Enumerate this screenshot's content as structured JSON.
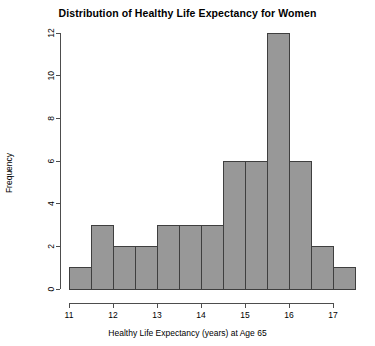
{
  "chart_data": {
    "type": "bar",
    "title": "Distribution of Healthy Life Expectancy for Women",
    "xlabel": "Healthy Life Expectancy (years) at Age 65",
    "ylabel": "Frequency",
    "bin_width": 0.5,
    "bin_edges": [
      11,
      11.5,
      12,
      12.5,
      13,
      13.5,
      14,
      14.5,
      15,
      15.5,
      16,
      16.5,
      17,
      17.5
    ],
    "categories": [
      "11-11.5",
      "11.5-12",
      "12-12.5",
      "12.5-13",
      "13-13.5",
      "13.5-14",
      "14-14.5",
      "14.5-15",
      "15-15.5",
      "15.5-16",
      "16-16.5",
      "16.5-17",
      "17-17.5"
    ],
    "values": [
      1,
      3,
      2,
      2,
      3,
      3,
      3,
      6,
      6,
      12,
      6,
      2,
      1
    ],
    "xlim": [
      11,
      17.5
    ],
    "ylim": [
      0,
      12
    ],
    "x_ticks": [
      11,
      12,
      13,
      14,
      15,
      16,
      17
    ],
    "x_tick_labels": [
      "11",
      "12",
      "13",
      "14",
      "15",
      "16",
      "17"
    ],
    "y_ticks": [
      0,
      2,
      4,
      6,
      8,
      10,
      12
    ],
    "y_tick_labels": [
      "0",
      "2",
      "4",
      "6",
      "8",
      "10",
      "12"
    ],
    "grid": false,
    "legend": "none",
    "bar_fill_color": "#989898",
    "bar_edge_color": "#3f3f3f",
    "axis_color": "#4d4d4d",
    "background_color": "#ffffff"
  }
}
